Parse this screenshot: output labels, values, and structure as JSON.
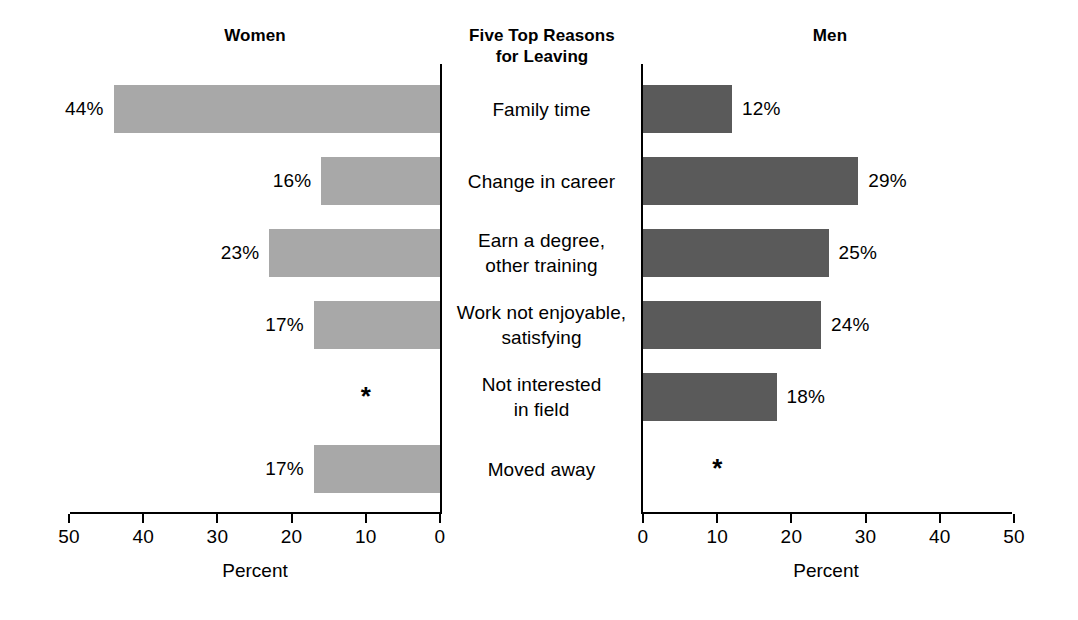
{
  "headers": {
    "left": "Women",
    "center": "Five Top Reasons\nfor Leaving",
    "center_line1": "Five Top Reasons",
    "center_line2": "for Leaving",
    "right": "Men"
  },
  "axis": {
    "left_title": "Percent",
    "right_title": "Percent",
    "left_ticks": [
      "50",
      "40",
      "30",
      "20",
      "10",
      "0"
    ],
    "right_ticks": [
      "0",
      "10",
      "20",
      "30",
      "40",
      "50"
    ],
    "suppressed_marker": "*"
  },
  "colors": {
    "women_bar": "#a8a8a8",
    "men_bar": "#5a5a5a",
    "axis": "#000000",
    "text": "#000000",
    "background": "#ffffff"
  },
  "chart_data": {
    "type": "bar",
    "title": "Five Top Reasons for Leaving",
    "orientation": "horizontal-diverging",
    "xlabel": "Percent",
    "ylabel": "",
    "xlim": [
      0,
      50
    ],
    "grid": false,
    "legend": "none",
    "categories": [
      "Family time",
      "Change in career",
      "Earn a degree, other training",
      "Work not enjoyable, satisfying",
      "Not interested in field",
      "Moved away"
    ],
    "category_lines": [
      [
        "Family time"
      ],
      [
        "Change in career"
      ],
      [
        "Earn a degree,",
        "other training"
      ],
      [
        "Work not enjoyable,",
        "satisfying"
      ],
      [
        "Not interested",
        "in field"
      ],
      [
        "Moved away"
      ]
    ],
    "series": [
      {
        "name": "Women",
        "side": "left",
        "values": [
          44,
          16,
          23,
          17,
          null,
          17
        ],
        "labels": [
          "44%",
          "16%",
          "23%",
          "17%",
          "*",
          "17%"
        ]
      },
      {
        "name": "Men",
        "side": "right",
        "values": [
          12,
          29,
          25,
          24,
          18,
          null
        ],
        "labels": [
          "12%",
          "29%",
          "25%",
          "24%",
          "18%",
          "*"
        ]
      }
    ]
  }
}
